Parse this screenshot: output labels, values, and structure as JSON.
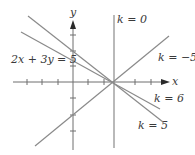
{
  "diagram": {
    "title": "",
    "axes": {
      "x_label": "x",
      "y_label": "y",
      "origin_px": [
        73,
        82
      ],
      "x_ticks_px": [
        27,
        42,
        58,
        88,
        104,
        135,
        151
      ],
      "y_ticks_px": [
        35,
        51,
        66,
        98,
        115,
        131
      ]
    },
    "lines": [
      {
        "id": "k0",
        "label": "k = 0",
        "from": [
          114,
          15
        ],
        "to": [
          114,
          148
        ]
      },
      {
        "id": "km5",
        "label": "k = −5",
        "from": [
          35,
          146
        ],
        "to": [
          169,
          36
        ]
      },
      {
        "id": "k6",
        "label": "k = 6",
        "from": [
          21,
          32
        ],
        "to": [
          160,
          109
        ]
      },
      {
        "id": "k5",
        "label": "k = 5",
        "from": [
          28,
          16
        ],
        "to": [
          163,
          122
        ]
      }
    ],
    "equation_label": "2x + 3y = 5",
    "labels": {
      "k0": "k = 0",
      "km5": "k = −5",
      "k6": "k = 6",
      "k5": "k = 5",
      "x": "x",
      "y": "y"
    },
    "colors": {
      "line": "#8a8a8a",
      "axis": "#6e6e6e",
      "text": "#3a3a3a",
      "background": "#ffffff"
    }
  }
}
